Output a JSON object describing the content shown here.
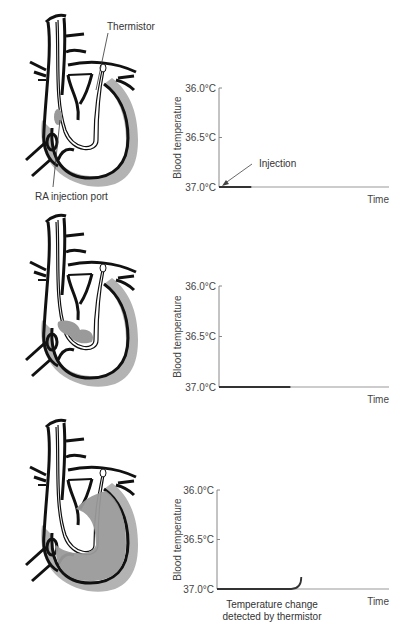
{
  "colors": {
    "outline": "#111111",
    "wall_gray": "#b3b3b3",
    "bolus_gray": "#9a9a9a",
    "axis": "#888888",
    "curve": "#333333",
    "text": "#333333"
  },
  "labels": {
    "thermistor": "Thermistor",
    "ra_port": "RA injection port",
    "injection": "Injection",
    "caption_3": [
      "Temperature change",
      "detected by thermistor"
    ]
  },
  "panels": [
    {
      "id": "panel-1",
      "stage": "injection",
      "bolus_location": "right-atrium",
      "chart": {
        "ylabel": "Blood temperature",
        "xlabel": "Time",
        "yticks": [
          "36.0°C",
          "36.5°C",
          "37.0°C"
        ],
        "ylim": [
          37.0,
          36.0
        ],
        "curve_fraction_of_time": 0.19,
        "curve_end_temp": 37.0,
        "annotation": "Injection"
      }
    },
    {
      "id": "panel-2",
      "stage": "transit",
      "bolus_location": "right-ventricle",
      "chart": {
        "ylabel": "Blood temperature",
        "xlabel": "Time",
        "yticks": [
          "36.0°C",
          "36.5°C",
          "37.0°C"
        ],
        "ylim": [
          37.0,
          36.0
        ],
        "curve_fraction_of_time": 0.42,
        "curve_end_temp": 37.0
      }
    },
    {
      "id": "panel-3",
      "stage": "detection",
      "bolus_location": "pulmonary-artery",
      "chart": {
        "ylabel": "Blood temperature",
        "xlabel": "Time",
        "yticks": [
          "36.0°C",
          "36.5°C",
          "37.0°C"
        ],
        "ylim": [
          37.0,
          36.0
        ],
        "curve_fraction_of_time": 0.49,
        "curve_end_temp": 36.88,
        "caption": "Temperature change detected by thermistor"
      }
    }
  ]
}
